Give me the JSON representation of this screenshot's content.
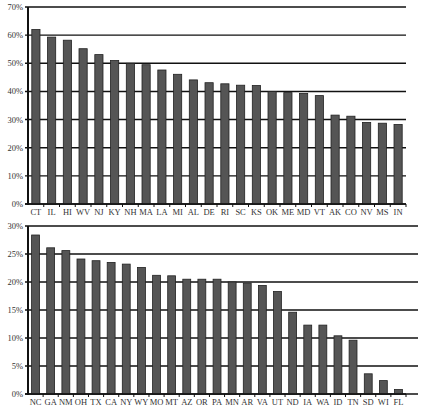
{
  "chart_data": [
    {
      "type": "bar",
      "title": "",
      "xlabel": "",
      "ylabel": "",
      "ylim": [
        0,
        70
      ],
      "yticks": [
        0,
        10,
        20,
        30,
        40,
        50,
        60,
        70
      ],
      "ytick_labels": [
        "0%",
        "10%",
        "20%",
        "30%",
        "40%",
        "50%",
        "60%",
        "70%"
      ],
      "grid": true,
      "legend": null,
      "categories": [
        "CT",
        "IL",
        "HI",
        "WV",
        "NJ",
        "KY",
        "NH",
        "MA",
        "LA",
        "MI",
        "AL",
        "DE",
        "RI",
        "SC",
        "KS",
        "OK",
        "ME",
        "MD",
        "VT",
        "AK",
        "CO",
        "NV",
        "MS",
        "IN"
      ],
      "values": [
        62,
        59.3,
        58.2,
        55.2,
        53.1,
        51,
        50,
        49.5,
        47.6,
        46.1,
        44.1,
        43.1,
        42.7,
        42.2,
        42.1,
        40,
        39.6,
        39.3,
        38.5,
        31.6,
        31.2,
        29,
        28.7,
        28.3
      ]
    },
    {
      "type": "bar",
      "title": "",
      "xlabel": "",
      "ylabel": "",
      "ylim": [
        0,
        30
      ],
      "yticks": [
        0,
        5,
        10,
        15,
        20,
        25,
        30
      ],
      "ytick_labels": [
        "0%",
        "5%",
        "10%",
        "15%",
        "20%",
        "25%",
        "30%"
      ],
      "grid": true,
      "legend": null,
      "categories": [
        "NC",
        "GA",
        "NM",
        "OH",
        "TX",
        "CA",
        "NY",
        "WY",
        "MO",
        "MT",
        "AZ",
        "OR",
        "PA",
        "MN",
        "AR",
        "VA",
        "UT",
        "ND",
        "IA",
        "WA",
        "ID",
        "TN",
        "SD",
        "WI",
        "FL"
      ],
      "values": [
        28.4,
        26.1,
        25.6,
        24.1,
        23.8,
        23.5,
        23.2,
        22.6,
        21.2,
        21.1,
        20.5,
        20.5,
        20.5,
        20,
        19.8,
        19.4,
        18.3,
        14.6,
        12.3,
        12.3,
        10.4,
        9.6,
        3.6,
        2.4,
        0.8
      ]
    }
  ],
  "colors": {
    "bar_fill": "#555555",
    "bar_stroke": "#222222",
    "grid": "#111111",
    "axis": "#111111",
    "text": "#333333",
    "background": "#ffffff"
  }
}
